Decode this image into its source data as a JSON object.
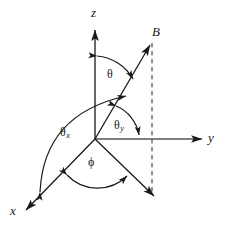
{
  "figure": {
    "type": "vector-angle-diagram",
    "background_color": "#ffffff",
    "stroke_color": "#1a1a1a",
    "axes": [
      {
        "key": "z",
        "label": "z",
        "name": "z-axis",
        "direction": "up"
      },
      {
        "key": "y",
        "label": "y",
        "name": "y-axis",
        "direction": "right"
      },
      {
        "key": "x",
        "label": "x",
        "name": "x-axis",
        "direction": "down-left"
      }
    ],
    "vectors": [
      {
        "key": "B",
        "label": "B",
        "name": "magnetic-field-vector",
        "direction": "up-right"
      },
      {
        "key": "proj",
        "label": "",
        "name": "xy-projection-vector",
        "direction": "down-right"
      }
    ],
    "angles": [
      {
        "key": "theta",
        "label": "θ",
        "sub": "",
        "name": "angle-theta",
        "between": "z-axis and B"
      },
      {
        "key": "theta_x",
        "label": "θ",
        "sub": "x",
        "name": "angle-theta-x",
        "between": "x-axis and B"
      },
      {
        "key": "theta_y",
        "label": "θ",
        "sub": "y",
        "name": "angle-theta-y",
        "between": "B and y-axis"
      },
      {
        "key": "phi",
        "label": "ϕ",
        "sub": "",
        "name": "angle-phi",
        "between": "x-axis and xy-projection"
      }
    ],
    "guides": [
      {
        "key": "dashed-vertical",
        "name": "dashed-projection-line",
        "style": "dashed"
      }
    ]
  }
}
